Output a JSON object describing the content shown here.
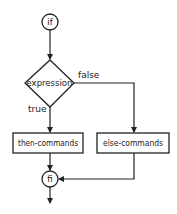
{
  "diagram": {
    "type": "flowchart",
    "nodes": {
      "start": {
        "label": "if",
        "shape": "circle"
      },
      "decision": {
        "label": "expression",
        "shape": "diamond"
      },
      "then": {
        "label": "then-commands",
        "shape": "rectangle"
      },
      "else": {
        "label": "else-commands",
        "shape": "rectangle"
      },
      "end": {
        "label": "fi",
        "shape": "circle"
      }
    },
    "edges": [
      {
        "from": "if",
        "to": "expression",
        "label": ""
      },
      {
        "from": "expression",
        "to": "then-commands",
        "label": "true"
      },
      {
        "from": "expression",
        "to": "else-commands",
        "label": "false"
      },
      {
        "from": "then-commands",
        "to": "fi",
        "label": ""
      },
      {
        "from": "else-commands",
        "to": "fi",
        "label": ""
      },
      {
        "from": "fi",
        "to": "exit",
        "label": ""
      }
    ],
    "edge_labels": {
      "true": "true",
      "false": "false"
    },
    "colors": {
      "stroke": "#222222",
      "background": "#ffffff"
    }
  }
}
